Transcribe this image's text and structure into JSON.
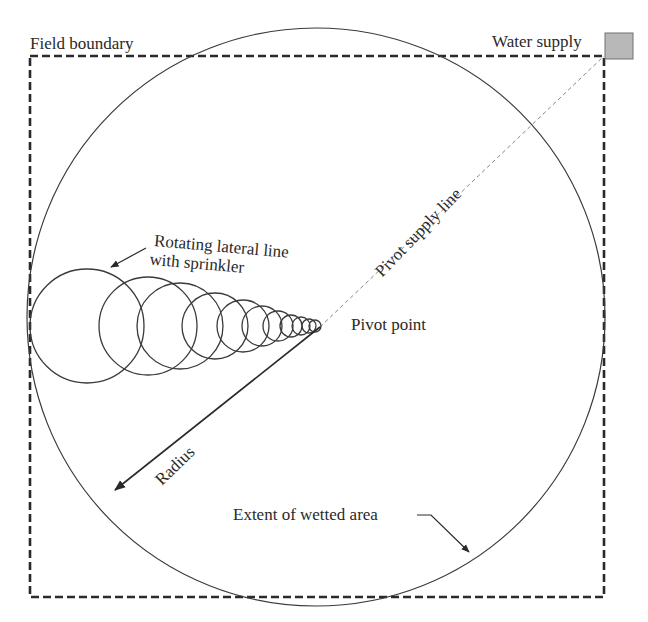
{
  "labels": {
    "field_boundary": "Field boundary",
    "water_supply": "Water supply",
    "rotating_lateral_line_1": "Rotating lateral line",
    "rotating_lateral_line_2": "with sprinkler",
    "pivot_supply_line": "Pivot supply line",
    "pivot_point": "Pivot point",
    "radius": "Radius",
    "extent_of_wetted_area": "Extent of wetted area"
  },
  "colors": {
    "line": "#2a2a2a",
    "water_supply_fill": "#b8b8b8",
    "water_supply_stroke": "#707070",
    "supply_line": "#888888"
  },
  "geometry": {
    "field_boundary": {
      "x": 30,
      "y": 56,
      "width": 574,
      "height": 541
    },
    "wetted_circle": {
      "cx": 316,
      "cy": 317,
      "r": 289
    },
    "pivot_point": {
      "x": 320,
      "y": 327
    },
    "water_supply_box": {
      "x": 605,
      "y": 33,
      "width": 28,
      "height": 26
    },
    "sprinkler_circles": [
      {
        "cx": 87,
        "cy": 326,
        "r": 57
      },
      {
        "cx": 148,
        "cy": 326,
        "r": 49
      },
      {
        "cx": 180,
        "cy": 326,
        "r": 43
      },
      {
        "cx": 215,
        "cy": 326,
        "r": 33
      },
      {
        "cx": 243,
        "cy": 326,
        "r": 26
      },
      {
        "cx": 262,
        "cy": 326,
        "r": 20
      },
      {
        "cx": 278,
        "cy": 326,
        "r": 15
      },
      {
        "cx": 291,
        "cy": 326,
        "r": 11
      },
      {
        "cx": 301,
        "cy": 326,
        "r": 9
      },
      {
        "cx": 309,
        "cy": 326,
        "r": 7
      },
      {
        "cx": 315,
        "cy": 326,
        "r": 6
      }
    ]
  }
}
